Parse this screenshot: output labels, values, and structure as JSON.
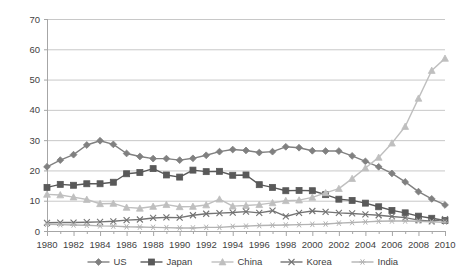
{
  "chart_data": {
    "type": "line",
    "title": "",
    "subtitle": "",
    "xlabel": "",
    "ylabel": "",
    "xlim": [
      1980,
      2010
    ],
    "ylim": [
      0,
      70
    ],
    "ytick_step": 10,
    "yticks": [
      "0",
      "10",
      "20",
      "30",
      "40",
      "50",
      "60",
      "70"
    ],
    "xticks": [
      "1980",
      "1982",
      "1984",
      "1986",
      "1988",
      "1990",
      "1992",
      "1994",
      "1996",
      "1998",
      "2000",
      "2002",
      "2004",
      "2006",
      "2008",
      "2010"
    ],
    "x": [
      1980,
      1981,
      1982,
      1983,
      1984,
      1985,
      1986,
      1987,
      1988,
      1989,
      1990,
      1991,
      1992,
      1993,
      1994,
      1995,
      1996,
      1997,
      1998,
      1999,
      2000,
      2001,
      2002,
      2003,
      2004,
      2005,
      2006,
      2007,
      2008,
      2009,
      2010
    ],
    "grid": true,
    "grid_axis": "y",
    "legend_position": "bottom",
    "series": [
      {
        "name": "US",
        "marker": "diamond",
        "color": "#808080",
        "values": [
          21.2,
          23.4,
          25.2,
          28.4,
          29.8,
          28.6,
          25.6,
          24.6,
          23.9,
          23.9,
          23.4,
          24.0,
          25.0,
          26.2,
          26.9,
          26.6,
          25.9,
          26.2,
          27.8,
          27.5,
          26.5,
          26.4,
          26.4,
          24.8,
          23.0,
          21.2,
          19.0,
          16.2,
          13.0,
          10.6,
          8.6
        ]
      },
      {
        "name": "Japan",
        "marker": "square",
        "color": "#595959",
        "values": [
          14.4,
          15.4,
          15.1,
          15.6,
          15.6,
          16.1,
          18.9,
          19.3,
          20.6,
          18.5,
          17.8,
          20.1,
          19.6,
          19.7,
          18.4,
          18.5,
          15.3,
          14.4,
          13.3,
          13.4,
          13.3,
          12.0,
          10.5,
          10.1,
          9.2,
          8.0,
          6.8,
          6.0,
          4.9,
          4.2,
          3.5
        ]
      },
      {
        "name": "China",
        "marker": "triangle",
        "color": "#bfbfbf",
        "values": [
          12.1,
          11.9,
          11.2,
          10.4,
          9.0,
          9.1,
          7.8,
          7.5,
          8.1,
          8.7,
          8.0,
          8.1,
          8.6,
          10.5,
          8.2,
          8.4,
          8.7,
          9.3,
          10.0,
          10.2,
          11.1,
          12.6,
          14.0,
          17.3,
          20.8,
          24.3,
          29.0,
          34.5,
          43.8,
          53.0,
          57.0
        ]
      },
      {
        "name": "Korea",
        "marker": "x",
        "color": "#737373",
        "values": [
          2.7,
          2.8,
          2.8,
          2.9,
          3.0,
          3.2,
          3.6,
          3.8,
          4.3,
          4.5,
          4.4,
          5.2,
          5.7,
          5.9,
          6.1,
          6.4,
          6.0,
          6.7,
          4.8,
          6.0,
          6.6,
          6.3,
          6.0,
          5.8,
          5.5,
          5.2,
          4.8,
          4.4,
          3.6,
          3.2,
          3.9
        ]
      },
      {
        "name": "India",
        "marker": "asterisk",
        "color": "#b3b3b3",
        "values": [
          2.2,
          2.1,
          2.0,
          1.9,
          1.7,
          1.6,
          1.4,
          1.3,
          1.2,
          1.1,
          1.0,
          1.0,
          1.2,
          1.2,
          1.5,
          1.6,
          1.8,
          1.9,
          2.0,
          2.1,
          2.2,
          2.3,
          2.6,
          2.8,
          3.0,
          3.2,
          3.3,
          3.3,
          3.2,
          3.0,
          2.9
        ]
      }
    ]
  },
  "legend": {
    "items": [
      {
        "label": "US"
      },
      {
        "label": "Japan"
      },
      {
        "label": "China"
      },
      {
        "label": "Korea"
      },
      {
        "label": "India"
      }
    ]
  },
  "colors": {
    "plot_border": "#a6a6a6",
    "gridline": "#c8c8c8",
    "axis_text": "#3f3f3f",
    "background": "#ffffff"
  }
}
